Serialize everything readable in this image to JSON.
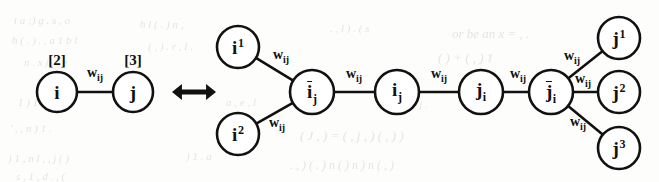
{
  "figure": {
    "type": "graph-transformation-diagram",
    "relation_symbol": "↔",
    "relation_name": "double-headed-arrow",
    "edge_weight_label": {
      "base": "w",
      "sub": "ij"
    },
    "colors": {
      "stroke": "#111111",
      "background": "#fdfdfc",
      "bleed": "#4a4a46"
    }
  },
  "left_graph": {
    "name": "original-edge",
    "nodes": [
      {
        "id": "i",
        "base": "i",
        "sub": "",
        "sup": "",
        "overbar": false,
        "cx": 57,
        "cy": 92,
        "r": 20,
        "bracket": "[2]",
        "bracket_x": 57,
        "bracket_y": 60
      },
      {
        "id": "j",
        "base": "j",
        "sub": "",
        "sup": "",
        "overbar": false,
        "cx": 133,
        "cy": 92,
        "r": 20,
        "bracket": "[3]",
        "bracket_x": 133,
        "bracket_y": 60
      }
    ],
    "edges": [
      {
        "from": "i",
        "to": "j",
        "label_x": 95,
        "label_y": 73
      }
    ]
  },
  "right_graph": {
    "name": "expanded-chain",
    "nodes": [
      {
        "id": "i1",
        "base": "i",
        "sub": "",
        "sup": "1",
        "overbar": false,
        "cx": 238,
        "cy": 47,
        "r": 21
      },
      {
        "id": "i2",
        "base": "i",
        "sub": "",
        "sup": "2",
        "overbar": false,
        "cx": 238,
        "cy": 134,
        "r": 21
      },
      {
        "id": "ibar_j",
        "base": "i",
        "sub": "j",
        "sup": "",
        "overbar": true,
        "cx": 312,
        "cy": 92,
        "r": 22
      },
      {
        "id": "i_j",
        "base": "i",
        "sub": "j",
        "sup": "",
        "overbar": false,
        "cx": 397,
        "cy": 92,
        "r": 22
      },
      {
        "id": "j_i",
        "base": "j",
        "sub": "i",
        "sup": "",
        "overbar": false,
        "cx": 481,
        "cy": 92,
        "r": 22
      },
      {
        "id": "jbar_i",
        "base": "j",
        "sub": "i",
        "sup": "",
        "overbar": true,
        "cx": 551,
        "cy": 92,
        "r": 22
      },
      {
        "id": "j1",
        "base": "j",
        "sub": "",
        "sup": "1",
        "overbar": false,
        "cx": 619,
        "cy": 38,
        "r": 21
      },
      {
        "id": "j2",
        "base": "j",
        "sub": "",
        "sup": "2",
        "overbar": false,
        "cx": 619,
        "cy": 92,
        "r": 21
      },
      {
        "id": "j3",
        "base": "j",
        "sub": "",
        "sup": "3",
        "overbar": false,
        "cx": 619,
        "cy": 148,
        "r": 21
      }
    ],
    "edges": [
      {
        "from": "i1",
        "to": "ibar_j",
        "label_x": 281,
        "label_y": 55
      },
      {
        "from": "i2",
        "to": "ibar_j",
        "label_x": 277,
        "label_y": 123
      },
      {
        "from": "ibar_j",
        "to": "i_j",
        "label_x": 354,
        "label_y": 74
      },
      {
        "from": "i_j",
        "to": "j_i",
        "label_x": 439,
        "label_y": 74
      },
      {
        "from": "j_i",
        "to": "jbar_i",
        "label_x": 518,
        "label_y": 74
      },
      {
        "from": "jbar_i",
        "to": "j1",
        "label_x": 572,
        "label_y": 56
      },
      {
        "from": "jbar_i",
        "to": "j2",
        "label_x": 583,
        "label_y": 79
      },
      {
        "from": "jbar_i",
        "to": "j3",
        "label_x": 578,
        "label_y": 122
      }
    ]
  },
  "arrow": {
    "name": "equivalence-arrow",
    "x": 194,
    "y": 92,
    "width": 44,
    "height": 16
  },
  "bleed_text": [
    {
      "t": "t  a    ;)  g   .   s    , o",
      "x": 14,
      "y": 14,
      "s": 11
    },
    {
      "t": "h   (  . ) . ,    a   1  b    l",
      "x": 12,
      "y": 34,
      "s": 11
    },
    {
      "t": "n   .  x   j    .   ,   e",
      "x": 24,
      "y": 56,
      "s": 11
    },
    {
      "t": "1    ) 1 .   r",
      "x": 18,
      "y": 96,
      "s": 11
    },
    {
      "t": "'   ,  ,   n   )    1 .",
      "x": 10,
      "y": 122,
      "s": 11
    },
    {
      "t": ")  1    , n  l ,    ,  j   (  )",
      "x": 8,
      "y": 152,
      "s": 11
    },
    {
      "t": "s   ,  1   ,  d  .  ,    (",
      "x": 16,
      "y": 170,
      "s": 11
    },
    {
      "t": "h   l    (  .  )   n  ,",
      "x": 140,
      "y": 18,
      "s": 11
    },
    {
      "t": "(  ,  ) .   r   ,    l .",
      "x": 148,
      "y": 40,
      "s": 11
    },
    {
      "t": ".   ,   l  ) .    (  s",
      "x": 330,
      "y": 22,
      "s": 11
    },
    {
      "t": "or  be  an  x  =  ,  .",
      "x": 452,
      "y": 26,
      "s": 13
    },
    {
      "t": "(  )  +   ( , )  1",
      "x": 438,
      "y": 50,
      "s": 13
    },
    {
      "t": "( J ,  )   =  (  ,    j ,  )  (  , ) )",
      "x": 300,
      "y": 128,
      "s": 13
    },
    {
      "t": ".  ,  )  (  .   ) n  (   )  n   ) n  (  ,  )",
      "x": 290,
      "y": 158,
      "s": 12
    },
    {
      "t": "a   ,  e   ,   l",
      "x": 226,
      "y": 96,
      "s": 11
    },
    {
      "t": "o  r   j   .",
      "x": 404,
      "y": 98,
      "s": 11
    },
    {
      "t": ")    1   .   a",
      "x": 186,
      "y": 150,
      "s": 11
    }
  ]
}
